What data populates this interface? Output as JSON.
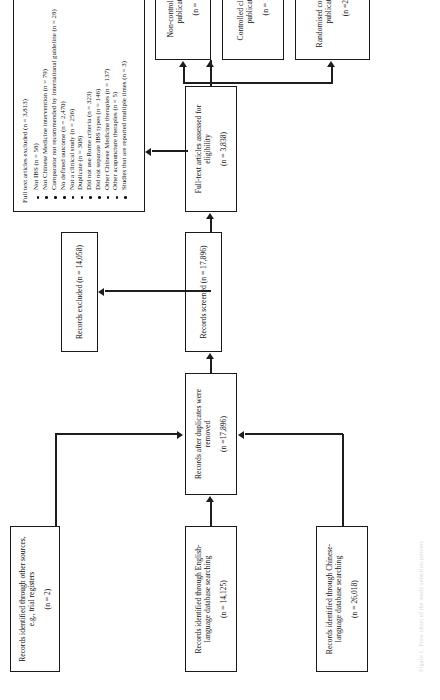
{
  "figure": {
    "type": "prisma-flow-diagram",
    "orientation": "rotated-90-ccw",
    "caption": "Figure 1. Flow chart of the study selection process"
  },
  "nodes": {
    "chinese_source": {
      "title": "Records identified through Chinese-language database searching",
      "count": "(n = 26,018)"
    },
    "english_source": {
      "title": "Records identified through English-language database searching",
      "count": "(n = 14,125)"
    },
    "other_source": {
      "title": "Records identified through other sources, e.g., trial registers",
      "count": "(n = 2)"
    },
    "duplicates_removed": {
      "title": "Records after duplicates were removed",
      "count": "(n =17,896)"
    },
    "screened": {
      "title": "Records screened (n = 17,896)",
      "count": ""
    },
    "records_excluded": {
      "title": "Records excluded (n = 14,058)",
      "count": ""
    },
    "eligibility": {
      "title": "Full-text articles assessed for eligibility",
      "count": "(n = 3,838)"
    },
    "fulltext_excluded": {
      "title": "Full text articles excluded (n = 3,813)",
      "reasons": [
        "Not IBS (n = 58)",
        "Not Chinese Medicine intervention (n = 79)",
        "Comparator not recommended by international guideline (n = 28)",
        "No defined outcome (n = 2,470)",
        "Not a clinical study (n = 256)",
        "Duplicate (n = 308)",
        "Did not use Rome criteria (n = 323)",
        "Did not separate IBS types (n = 146)",
        "Other Chinese Medicine therapies (n = 137)",
        "Other acupuncture therapies (n = 5)",
        "Studies that are reported multiple times (n = 3)"
      ]
    },
    "non_controlled": {
      "title": "Non-controlled study publications",
      "count": "(n = 1)"
    },
    "controlled_clinical": {
      "title": "Controlled clinical trial publications",
      "count": "(n = 1)"
    },
    "randomised_controlled": {
      "title": "Randomised controlled trial publications",
      "count": "(n =23)"
    }
  },
  "style": {
    "ink": "#101010",
    "border": "#1a1a1a",
    "paper": "#ffffff"
  }
}
